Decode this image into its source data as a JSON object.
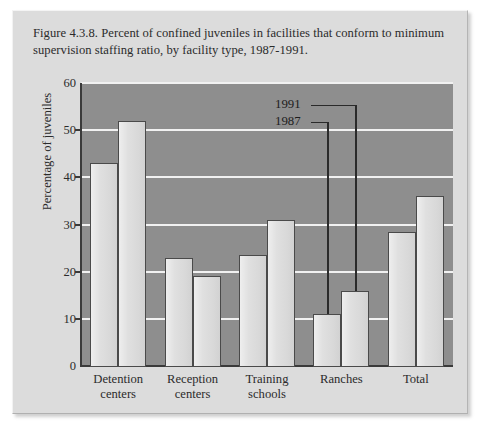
{
  "figure": {
    "caption": "Figure 4.3.8. Percent of confined juveniles in facilities that conform to minimum supervision staffing ratio, by facility type, 1987-1991."
  },
  "chart_data": {
    "type": "bar",
    "title": "Figure 4.3.8. Percent of confined juveniles in facilities that conform to minimum supervision staffing ratio, by facility type, 1987-1991.",
    "xlabel": "",
    "ylabel": "Percentage of juveniles",
    "ylim": [
      0,
      60
    ],
    "yticks": [
      0,
      10,
      20,
      30,
      40,
      50,
      60
    ],
    "ytick_labels": [
      "0",
      "10",
      "20",
      "30",
      "40",
      "50",
      "60"
    ],
    "grid": true,
    "legend_position": "inside-top-center",
    "categories": [
      "Detention centers",
      "Reception centers",
      "Training schools",
      "Ranches",
      "Total"
    ],
    "category_lines": [
      [
        "Detention",
        "centers"
      ],
      [
        "Reception",
        "centers"
      ],
      [
        "Training",
        "schools"
      ],
      [
        "Ranches"
      ],
      [
        "Total"
      ]
    ],
    "series": [
      {
        "name": "1987",
        "values": [
          43,
          23,
          23.5,
          11,
          28.5
        ]
      },
      {
        "name": "1991",
        "values": [
          52,
          19,
          31,
          16,
          36
        ]
      }
    ]
  },
  "colors": {
    "page_background": "#ffffff",
    "panel_background": "#dcdcdc",
    "plot_background": "#8e8e8e",
    "gridline": "#f1f1f1",
    "bar_fill": "#dadada",
    "bar_outline": "#4a4a4a",
    "axis": "#3a3a3a",
    "text": "#2b2b2b"
  }
}
